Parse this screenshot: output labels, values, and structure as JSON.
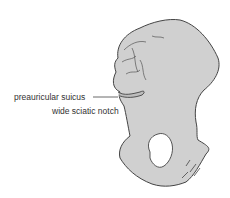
{
  "figure": {
    "colors": {
      "bone_fill": "#d0d0d0",
      "outline": "#444444",
      "label_text": "#333333"
    },
    "labels": [
      {
        "id": "preauricular-sulcus",
        "text": "preauricular suicus"
      },
      {
        "id": "sciatic-notch",
        "text": "wide sciatic notch"
      }
    ]
  }
}
